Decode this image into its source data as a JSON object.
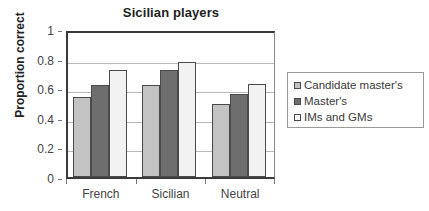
{
  "chart_data": {
    "type": "bar",
    "title": "Sicilian players",
    "xlabel": "",
    "ylabel": "Proportion correct",
    "categories": [
      "French",
      "Sicilian",
      "Neutral"
    ],
    "series": [
      {
        "name": "Candidate master's",
        "values": [
          0.54,
          0.62,
          0.49
        ],
        "color": "#c3c3c3"
      },
      {
        "name": "Master's",
        "values": [
          0.62,
          0.72,
          0.56
        ],
        "color": "#6e6e6e"
      },
      {
        "name": "IMs and GMs",
        "values": [
          0.72,
          0.78,
          0.63
        ],
        "color": "#f2f2f2"
      }
    ],
    "ylim": [
      0,
      1
    ],
    "yticks": [
      0,
      0.2,
      0.4,
      0.6,
      0.8,
      1
    ],
    "ytick_labels": [
      "0",
      "0.2",
      "0.4",
      "0.6",
      "0.8",
      "1"
    ],
    "grid": "horizontal",
    "legend_position": "right"
  }
}
